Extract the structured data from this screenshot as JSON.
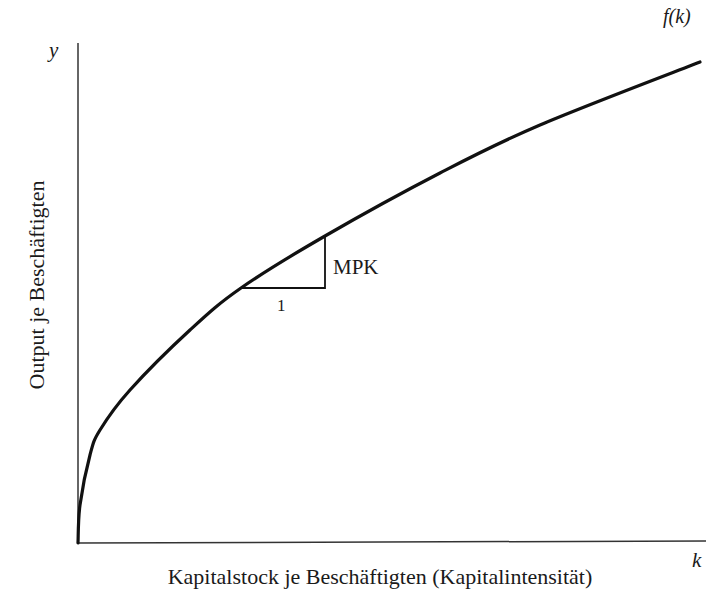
{
  "diagram": {
    "type": "production-function",
    "axes": {
      "y_symbol": "y",
      "x_symbol": "k",
      "y_title": "Output je Beschäftigten",
      "x_title": "Kapitalstock je Beschäftigten (Kapitalintensität)"
    },
    "curve": {
      "label": "f(k)",
      "shape": "concave increasing, starting at origin",
      "points": [
        [
          78,
          543
        ],
        [
          80,
          505
        ],
        [
          90,
          455
        ],
        [
          100,
          430
        ],
        [
          130,
          390
        ],
        [
          190,
          330
        ],
        [
          241,
          288
        ],
        [
          325,
          236
        ],
        [
          440,
          173
        ],
        [
          540,
          125
        ],
        [
          700,
          62
        ]
      ]
    },
    "slope_triangle": {
      "run_label": "1",
      "rise_label": "MPK",
      "base_start": [
        241,
        288
      ],
      "base_end": [
        325,
        288
      ],
      "top": [
        325,
        236
      ]
    },
    "colors": {
      "line": "#111111",
      "axis": "#333333",
      "background": "#ffffff"
    }
  }
}
